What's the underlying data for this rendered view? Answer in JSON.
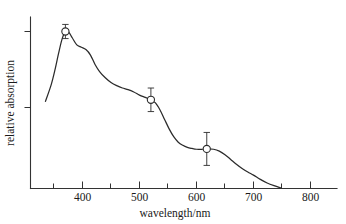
{
  "chart_data": {
    "type": "line",
    "title": "",
    "xlabel": "wavelength/nm",
    "ylabel": "relative absorption",
    "xlim": [
      330,
      820
    ],
    "ylim": [
      0,
      1.12
    ],
    "grid": false,
    "legend": "none",
    "xticks_major": [
      400,
      500,
      600,
      700,
      800
    ],
    "xtick_labels": [
      "400",
      "500",
      "600",
      "700",
      "800"
    ],
    "xticks_minor": [
      350,
      450,
      550,
      650,
      750
    ],
    "yticks_major": [
      0.52,
      1.0
    ],
    "ytick_labels": [
      "",
      ""
    ],
    "series": [
      {
        "name": "absorption spectrum",
        "x": [
          335,
          345,
          352,
          358,
          364,
          370,
          376,
          382,
          390,
          398,
          406,
          414,
          422,
          430,
          440,
          450,
          460,
          470,
          480,
          490,
          500,
          510,
          520,
          528,
          536,
          544,
          552,
          560,
          568,
          576,
          584,
          592,
          600,
          610,
          620,
          630,
          640,
          650,
          660,
          670,
          680,
          690,
          700,
          712,
          724,
          736,
          748
        ],
        "y": [
          0.555,
          0.66,
          0.76,
          0.86,
          0.95,
          1.0,
          0.995,
          0.96,
          0.915,
          0.9,
          0.885,
          0.85,
          0.79,
          0.745,
          0.705,
          0.675,
          0.655,
          0.64,
          0.63,
          0.615,
          0.595,
          0.58,
          0.565,
          0.545,
          0.5,
          0.44,
          0.38,
          0.33,
          0.295,
          0.275,
          0.262,
          0.255,
          0.25,
          0.25,
          0.252,
          0.25,
          0.238,
          0.215,
          0.185,
          0.155,
          0.128,
          0.105,
          0.085,
          0.058,
          0.035,
          0.018,
          0.004
        ]
      }
    ],
    "points": [
      {
        "x": 370,
        "y": 1.0,
        "yerr": 0.045,
        "marker": "open-circle"
      },
      {
        "x": 520,
        "y": 0.565,
        "yerr": 0.075,
        "marker": "open-circle"
      },
      {
        "x": 618,
        "y": 0.252,
        "yerr": 0.105,
        "marker": "open-circle"
      }
    ],
    "colors": {
      "curve": "#2b2b2b",
      "axis": "#333333",
      "marker_face": "#ffffff",
      "background": "#ffffff"
    }
  }
}
